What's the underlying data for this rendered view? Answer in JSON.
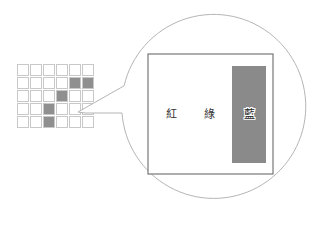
{
  "grid": {
    "rows": 5,
    "cols": 6,
    "origin": [
      17,
      64
    ],
    "cell_size": 11,
    "pitch": 13,
    "filled": [
      [
        1,
        4
      ],
      [
        1,
        5
      ],
      [
        2,
        3
      ],
      [
        3,
        2
      ],
      [
        4,
        2
      ]
    ],
    "stroke": "#c8c8c8",
    "fill": "#8f8f8f"
  },
  "magnifier": {
    "center": [
      212,
      113
    ],
    "radius": 92,
    "stroke": "#b5b5b5",
    "callout_point": [
      78,
      112
    ]
  },
  "panel": {
    "rect": [
      148,
      54,
      125,
      120
    ],
    "stroke": "#777777",
    "bar": {
      "rect": [
        232,
        66,
        34,
        97
      ],
      "fill": "#8a8a8a"
    },
    "labels": [
      {
        "text": "紅",
        "x": 171
      },
      {
        "text": "綠",
        "x": 209
      },
      {
        "text": "藍",
        "x": 249
      }
    ]
  }
}
